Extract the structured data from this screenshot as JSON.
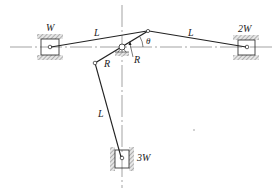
{
  "diagram": {
    "type": "mechanism",
    "colors": {
      "line": "#222222",
      "hatch": "#9a9a9a",
      "centerline": "#666666"
    },
    "labels": {
      "slider_left": "W",
      "slider_right": "2W",
      "slider_bottom": "3W",
      "link_left": "L",
      "link_right": "L",
      "link_bottom": "L",
      "crank_arm_lower": "R",
      "crank_arm_upper": "R",
      "angle": "θ"
    }
  }
}
